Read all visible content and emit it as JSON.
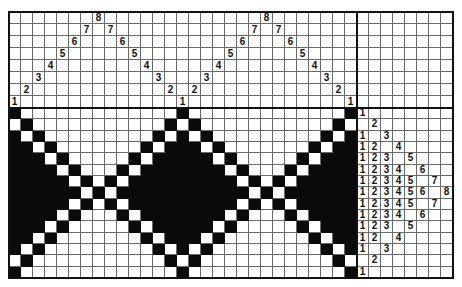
{
  "draft": {
    "type": "weaving-draft-point-twill",
    "shafts": 8,
    "treadles": 8,
    "threading": [
      1,
      2,
      3,
      4,
      5,
      6,
      7,
      8,
      7,
      6,
      5,
      4,
      3,
      2,
      1,
      2,
      3,
      4,
      5,
      6,
      7,
      8,
      7,
      6,
      5,
      4,
      3,
      2,
      1
    ],
    "tieup_blank": true,
    "treadling": [
      [
        1
      ],
      [
        2
      ],
      [
        1,
        3
      ],
      [
        1,
        2,
        4
      ],
      [
        1,
        2,
        3,
        5
      ],
      [
        1,
        2,
        3,
        4,
        6
      ],
      [
        1,
        2,
        3,
        4,
        5,
        7
      ],
      [
        1,
        2,
        3,
        4,
        5,
        6,
        8
      ],
      [
        1,
        2,
        3,
        4,
        5,
        7
      ],
      [
        1,
        2,
        3,
        4,
        6
      ],
      [
        1,
        2,
        3,
        5
      ],
      [
        1,
        2,
        4
      ],
      [
        1,
        3
      ],
      [
        2
      ],
      [
        1
      ]
    ],
    "colors": {
      "grid_line": "#6a6a6a",
      "filled": "#0a0a0a",
      "empty": "#ffffff",
      "frame": "#111111"
    }
  }
}
